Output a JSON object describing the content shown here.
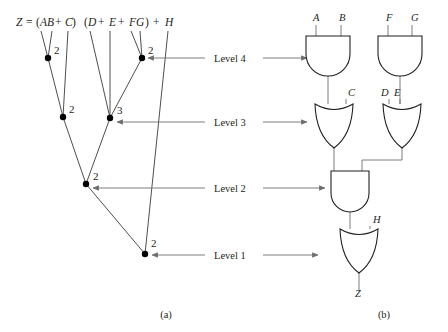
{
  "figure": {
    "part_a_label": "(a)",
    "part_b_label": "(b)",
    "expression": {
      "full": "Z = (AB + C) (D + E + FG) + H",
      "tokens": [
        {
          "text": "Z",
          "style": "italic",
          "x": 16,
          "y": 26
        },
        {
          "text": "=",
          "style": "roman",
          "x": 26,
          "y": 26
        },
        {
          "text": "(",
          "style": "roman",
          "x": 36,
          "y": 26
        },
        {
          "text": "AB",
          "style": "italic",
          "x": 40,
          "y": 26
        },
        {
          "text": "+",
          "style": "roman",
          "x": 55,
          "y": 26
        },
        {
          "text": "C",
          "style": "italic",
          "x": 65,
          "y": 26
        },
        {
          "text": ")",
          "style": "roman",
          "x": 72,
          "y": 26
        },
        {
          "text": "(",
          "style": "roman",
          "x": 84,
          "y": 26
        },
        {
          "text": "D",
          "style": "italic",
          "x": 88,
          "y": 26
        },
        {
          "text": "+",
          "style": "roman",
          "x": 98,
          "y": 26
        },
        {
          "text": "E",
          "style": "italic",
          "x": 109,
          "y": 26
        },
        {
          "text": "+",
          "style": "roman",
          "x": 118,
          "y": 26
        },
        {
          "text": "FG",
          "style": "italic",
          "x": 129,
          "y": 26
        },
        {
          "text": ")",
          "style": "roman",
          "x": 145,
          "y": 26
        },
        {
          "text": "+",
          "style": "roman",
          "x": 153,
          "y": 26
        },
        {
          "text": "H",
          "style": "italic",
          "x": 165,
          "y": 26
        }
      ]
    },
    "tree": {
      "nodes": [
        {
          "id": "n-and-ab",
          "x": 48,
          "y": 58,
          "fanin": "2",
          "label_x": 54,
          "label_y": 54
        },
        {
          "id": "n-and-fg",
          "x": 142,
          "y": 58,
          "fanin": "2",
          "label_x": 148,
          "label_y": 54
        },
        {
          "id": "n-or-abc",
          "x": 63,
          "y": 117,
          "fanin": "2",
          "label_x": 69,
          "label_y": 113
        },
        {
          "id": "n-or-defg",
          "x": 110,
          "y": 118,
          "fanin": "3",
          "label_x": 117,
          "label_y": 114
        },
        {
          "id": "n-and-prod",
          "x": 86,
          "y": 184,
          "fanin": "2",
          "label_x": 93,
          "label_y": 180
        },
        {
          "id": "n-or-root",
          "x": 145,
          "y": 254,
          "fanin": "2",
          "label_x": 151,
          "label_y": 247
        }
      ],
      "edges": [
        {
          "id": "edge-a",
          "x1": 41,
          "y1": 31,
          "x2": 48,
          "y2": 58
        },
        {
          "id": "edge-b",
          "x1": 52,
          "y1": 31,
          "x2": 48,
          "y2": 58
        },
        {
          "id": "edge-and-or",
          "x1": 48,
          "y1": 58,
          "x2": 63,
          "y2": 117
        },
        {
          "id": "edge-c",
          "x1": 68,
          "y1": 31,
          "x2": 63,
          "y2": 117
        },
        {
          "id": "edge-d",
          "x1": 90,
          "y1": 31,
          "x2": 110,
          "y2": 118
        },
        {
          "id": "edge-e",
          "x1": 110,
          "y1": 31,
          "x2": 110,
          "y2": 118
        },
        {
          "id": "edge-f",
          "x1": 131,
          "y1": 31,
          "x2": 142,
          "y2": 58
        },
        {
          "id": "edge-g",
          "x1": 140,
          "y1": 31,
          "x2": 142,
          "y2": 58
        },
        {
          "id": "edge-fg-or",
          "x1": 142,
          "y1": 58,
          "x2": 110,
          "y2": 118
        },
        {
          "id": "edge-or1-and",
          "x1": 63,
          "y1": 117,
          "x2": 86,
          "y2": 184
        },
        {
          "id": "edge-or2-and",
          "x1": 110,
          "y1": 118,
          "x2": 86,
          "y2": 184
        },
        {
          "id": "edge-and-root",
          "x1": 86,
          "y1": 184,
          "x2": 145,
          "y2": 254
        },
        {
          "id": "edge-h",
          "x1": 168,
          "y1": 31,
          "x2": 145,
          "y2": 254
        }
      ]
    },
    "levels": [
      {
        "id": "level-4",
        "label": "Level 4",
        "y": 58,
        "text_x": 214,
        "arrow_left_x": 205,
        "arrow_left_tip": 148,
        "arrow_right_x": 263,
        "arrow_right_tip": 307
      },
      {
        "id": "level-3",
        "label": "Level 3",
        "y": 122,
        "text_x": 214,
        "arrow_left_x": 205,
        "arrow_left_tip": 117,
        "arrow_right_x": 263,
        "arrow_right_tip": 307
      },
      {
        "id": "level-2",
        "label": "Level 2",
        "y": 188,
        "text_x": 214,
        "arrow_left_x": 205,
        "arrow_left_tip": 93,
        "arrow_right_x": 263,
        "arrow_right_tip": 325
      },
      {
        "id": "level-1",
        "label": "Level 1",
        "y": 255,
        "text_x": 214,
        "arrow_left_x": 205,
        "arrow_left_tip": 152,
        "arrow_right_x": 263,
        "arrow_right_tip": 318
      }
    ],
    "circuit": {
      "gates": [
        {
          "id": "gate-and-ab",
          "type": "AND",
          "x": 306,
          "y": 36,
          "w": 44,
          "h": 40
        },
        {
          "id": "gate-and-fg",
          "type": "AND",
          "x": 378,
          "y": 36,
          "w": 44,
          "h": 40
        },
        {
          "id": "gate-or-abc",
          "type": "OR",
          "x": 315,
          "y": 104,
          "w": 38,
          "h": 44
        },
        {
          "id": "gate-or-defg",
          "type": "OR",
          "x": 383,
          "y": 104,
          "w": 38,
          "h": 44
        },
        {
          "id": "gate-and-prod",
          "type": "AND",
          "x": 331,
          "y": 171,
          "w": 38,
          "h": 41
        },
        {
          "id": "gate-or-root",
          "type": "OR",
          "x": 340,
          "y": 229,
          "w": 38,
          "h": 44
        }
      ],
      "signal_labels": [
        {
          "id": "sig-a",
          "text": "A",
          "x": 313,
          "y": 21
        },
        {
          "id": "sig-b",
          "text": "B",
          "x": 339,
          "y": 21
        },
        {
          "id": "sig-f",
          "text": "F",
          "x": 386,
          "y": 21
        },
        {
          "id": "sig-g",
          "text": "G",
          "x": 411,
          "y": 21
        },
        {
          "id": "sig-c",
          "text": "C",
          "x": 348,
          "y": 96
        },
        {
          "id": "sig-d",
          "text": "D",
          "x": 381,
          "y": 96
        },
        {
          "id": "sig-e",
          "text": "E",
          "x": 394,
          "y": 96
        },
        {
          "id": "sig-h",
          "text": "H",
          "x": 373,
          "y": 223
        },
        {
          "id": "sig-z",
          "text": "Z",
          "x": 355,
          "y": 297
        }
      ],
      "wires": [
        {
          "id": "wire-a-in",
          "d": "M 316 25 L 316 36"
        },
        {
          "id": "wire-b-in",
          "d": "M 341 25 L 341 36"
        },
        {
          "id": "wire-f-in",
          "d": "M 388 25 L 388 36"
        },
        {
          "id": "wire-g-in",
          "d": "M 412 25 L 412 36"
        },
        {
          "id": "wire-and1-or1",
          "d": "M 328 76 L 328 104"
        },
        {
          "id": "wire-c-in",
          "d": "M 346 99 L 346 104"
        },
        {
          "id": "wire-and2-or2",
          "d": "M 400 76 L 400 104"
        },
        {
          "id": "wire-d-in",
          "d": "M 389 99 L 389 104"
        },
        {
          "id": "wire-e-in",
          "d": "M 400 99 L 400 104"
        },
        {
          "id": "wire-or1-and3",
          "d": "M 334 148 L 334 171"
        },
        {
          "id": "wire-or2-and3",
          "d": "M 402 148 L 402 160 L 362 160 L 362 171"
        },
        {
          "id": "wire-and3-or4",
          "d": "M 350 212 L 350 229"
        },
        {
          "id": "wire-h-in",
          "d": "M 370 226 L 370 229"
        },
        {
          "id": "wire-z-out",
          "d": "M 359 270 L 359 291"
        }
      ]
    }
  }
}
